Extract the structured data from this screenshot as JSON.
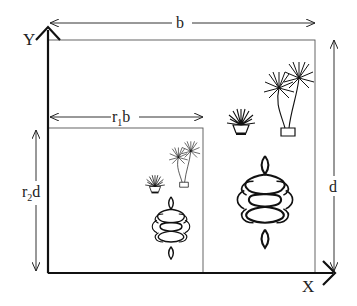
{
  "diagram": {
    "axes": {
      "y_label": "Y",
      "x_label": "X"
    },
    "outer_rect": {
      "width_label": "b",
      "height_label": "d"
    },
    "inner_rect": {
      "width_label_main": "r",
      "width_label_sub": "1",
      "width_label_tail": "b",
      "height_label_main": "r",
      "height_label_sub": "2",
      "height_label_tail": "d"
    },
    "decorations": {
      "outer": [
        "potted-plant-small",
        "potted-palm-tall",
        "celtic-knot-ornament"
      ],
      "inner": [
        "potted-plant-small",
        "potted-palm-tall",
        "celtic-knot-ornament"
      ]
    },
    "colors": {
      "ink": "#1a1a1a",
      "thin_line": "#444444"
    }
  }
}
